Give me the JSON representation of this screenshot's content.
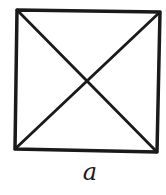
{
  "diagram": {
    "shape": "square-with-diagonals",
    "label": "a",
    "stroke_color": "#1a1a1a",
    "background": "#ffffff",
    "corners": {
      "top_left": [
        17,
        10
      ],
      "top_right": [
        160,
        12
      ],
      "bottom_right": [
        157,
        152
      ],
      "bottom_left": [
        15,
        149
      ]
    }
  }
}
